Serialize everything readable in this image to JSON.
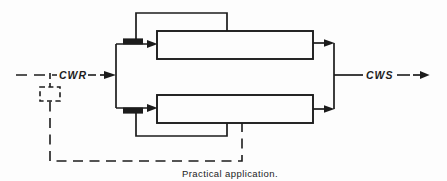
{
  "colors": {
    "ink": "#1c1c1c",
    "paper": "#fdfdfd"
  },
  "figure": {
    "inlet_label": "CWR",
    "outlet_label": "CWS",
    "caption": "Practical application."
  }
}
